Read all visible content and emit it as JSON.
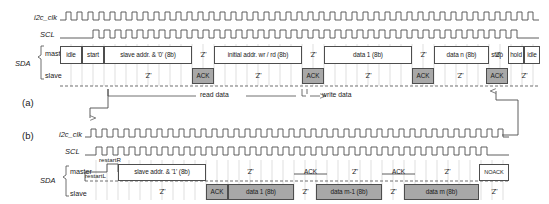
{
  "figure": {
    "panels": [
      "(a)",
      "(b)"
    ],
    "colors": {
      "line": "#4d4d4d",
      "grey_fill": "#a8a8a8",
      "white_fill": "#ffffff",
      "text": "#1a1a1a",
      "gridline": "#b5b5b5"
    }
  },
  "panel_a": {
    "id": "(a)",
    "signals": {
      "clk": "i2c_clk",
      "scl": "SCL",
      "sda": "SDA",
      "master": "master",
      "slave": "slave"
    },
    "master_row": [
      {
        "label": "idle",
        "style": "box"
      },
      {
        "label": "start",
        "style": "box"
      },
      {
        "label": "slave addr. & '0' (8b)",
        "style": "box"
      },
      {
        "label": "'Z'",
        "style": "plain"
      },
      {
        "label": "initial addr. wr / rd (8b)",
        "style": "box"
      },
      {
        "label": "'Z'",
        "style": "plain"
      },
      {
        "label": "data 1 (8b)",
        "style": "box"
      },
      {
        "label": "'Z'",
        "style": "plain"
      },
      {
        "label": "data n (8b)",
        "style": "box"
      },
      {
        "label": "'Z'",
        "style": "plain"
      },
      {
        "label": "stop",
        "style": "box"
      },
      {
        "label": "hold",
        "style": "box"
      },
      {
        "label": "idle",
        "style": "box"
      }
    ],
    "slave_row": [
      {
        "label": "'Z'",
        "style": "plain"
      },
      {
        "label": "ACK",
        "style": "grey"
      },
      {
        "label": "'Z'",
        "style": "plain"
      },
      {
        "label": "ACK",
        "style": "grey"
      },
      {
        "label": "'Z'",
        "style": "plain"
      },
      {
        "label": "ACK",
        "style": "grey"
      },
      {
        "label": "'Z'",
        "style": "plain"
      },
      {
        "label": "ACK",
        "style": "grey"
      },
      {
        "label": "'Z'",
        "style": "plain"
      }
    ],
    "annotations": {
      "read_data": "read data",
      "write_data": "write data"
    }
  },
  "panel_b": {
    "id": "(b)",
    "signals": {
      "clk": "i2c_clk",
      "scl": "SCL",
      "sda": "SDA",
      "master": "master",
      "slave": "slave"
    },
    "restart_upper": "restartR",
    "restart_lower": "restartL",
    "master_row": [
      {
        "label": "slave addr. & '1' (8b)",
        "style": "box"
      },
      {
        "label": "'Z'",
        "style": "plain"
      },
      {
        "label": "ACK",
        "style": "plain"
      },
      {
        "label": "'Z'",
        "style": "plain"
      },
      {
        "label": "ACK",
        "style": "plain"
      },
      {
        "label": "'Z'",
        "style": "plain"
      },
      {
        "label": "NOACK",
        "style": "box"
      }
    ],
    "slave_row": [
      {
        "label": "'Z'",
        "style": "plain"
      },
      {
        "label": "ACK",
        "style": "grey"
      },
      {
        "label": "data 1 (8b)",
        "style": "grey"
      },
      {
        "label": "'Z'",
        "style": "plain"
      },
      {
        "label": "data m-1 (8b)",
        "style": "grey"
      },
      {
        "label": "'Z'",
        "style": "plain"
      },
      {
        "label": "data m (8b)",
        "style": "grey"
      },
      {
        "label": "'Z'",
        "style": "plain"
      }
    ]
  }
}
